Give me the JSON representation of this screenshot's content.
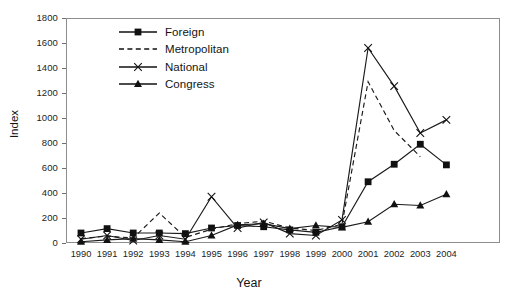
{
  "chart_data": {
    "type": "line",
    "title": "",
    "xlabel": "Year",
    "ylabel": "Index",
    "xlim": [
      1989.5,
      2004.8
    ],
    "ylim": [
      0,
      1800
    ],
    "ytick_step": 200,
    "grid": false,
    "legend_position": "top-center",
    "categories": [
      "1990",
      "1991",
      "1992",
      "1993",
      "1994",
      "1995",
      "1996",
      "1997",
      "1998",
      "1999",
      "2000",
      "2001",
      "2002",
      "2003",
      "2004"
    ],
    "series": [
      {
        "name": "Foreign",
        "marker": "filled-square",
        "line": "solid",
        "values": [
          80,
          115,
          80,
          80,
          75,
          120,
          140,
          130,
          105,
          85,
          130,
          490,
          630,
          790,
          625
        ]
      },
      {
        "name": "Metropolitan",
        "marker": "none",
        "line": "dashed",
        "values": [
          35,
          55,
          40,
          240,
          45,
          110,
          155,
          175,
          120,
          100,
          150,
          1290,
          900,
          690,
          null
        ]
      },
      {
        "name": "National",
        "marker": "x-cross",
        "line": "solid",
        "values": [
          30,
          60,
          20,
          60,
          30,
          370,
          120,
          165,
          75,
          60,
          185,
          1560,
          1255,
          880,
          985
        ]
      },
      {
        "name": "Congress",
        "marker": "filled-triangle",
        "line": "solid",
        "values": [
          10,
          25,
          35,
          25,
          10,
          60,
          145,
          155,
          115,
          140,
          125,
          170,
          310,
          300,
          390
        ]
      }
    ],
    "ytick_labels": [
      "0",
      "200",
      "400",
      "600",
      "800",
      "1000",
      "1200",
      "1400",
      "1600",
      "1800"
    ],
    "colors": {
      "series_line": "#1a1a1a",
      "axis": "#8d8d8d",
      "text": "#1a1a1a"
    }
  },
  "caption": {
    "text": ""
  }
}
